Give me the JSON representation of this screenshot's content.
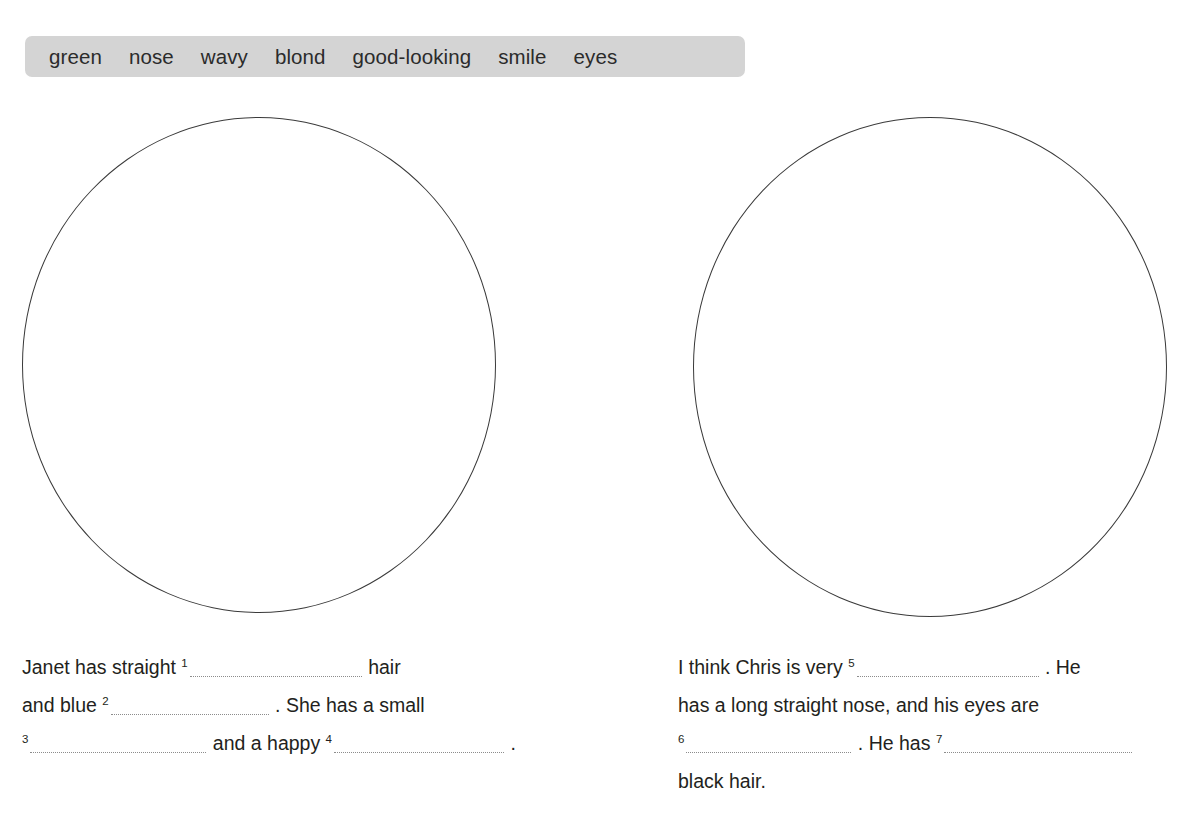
{
  "worksheet": {
    "word_bank": {
      "words": [
        "green",
        "nose",
        "wavy",
        "blond",
        "good-looking",
        "smile",
        "eyes"
      ],
      "background_color": "#d4d4d4"
    },
    "drawing_areas": [
      {
        "name": "janet-face-circle",
        "label": ""
      },
      {
        "name": "chris-face-circle",
        "label": ""
      }
    ],
    "left_text": {
      "line1_a": "Janet has straight ",
      "line1_num": "1",
      "line1_b": " hair",
      "line2_a": "and blue ",
      "line2_num": "2",
      "line2_b": " . She has a small",
      "line3_num": "3",
      "line3_a": " and a happy ",
      "line3_num2": "4",
      "line3_b": " ."
    },
    "right_text": {
      "line1_a": "I think Chris is very ",
      "line1_num": "5",
      "line1_b": " . He",
      "line2": "has a long straight nose, and his eyes are",
      "line3_num": "6",
      "line3_a": " . He has ",
      "line3_num2": "7",
      "line4": "black hair."
    }
  }
}
